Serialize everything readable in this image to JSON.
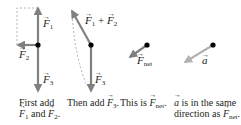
{
  "panels": [
    {
      "id": "panel-1",
      "vectors": [
        {
          "label": "F",
          "sub": "1",
          "direction": "up"
        },
        {
          "label": "F",
          "sub": "2",
          "direction": "left"
        },
        {
          "label": "F",
          "sub": "3",
          "direction": "down"
        }
      ],
      "caption_line1": "First add",
      "caption_line2": {
        "a": "F",
        "a_sub": "1",
        "mid": " and ",
        "b": "F",
        "b_sub": "2",
        "end": "."
      }
    },
    {
      "id": "panel-2",
      "vectors": [
        {
          "label": "F⃗₁ + F⃗₂",
          "sum_a": "F",
          "sum_a_sub": "1",
          "plus": "+",
          "sum_b": "F",
          "sum_b_sub": "2",
          "direction": "up-left"
        },
        {
          "label": "F",
          "sub": "3",
          "direction": "down"
        }
      ],
      "caption_prefix": "Then add ",
      "caption_vec": "F",
      "caption_sub": "3",
      "caption_end": "."
    },
    {
      "id": "panel-3",
      "vectors": [
        {
          "label": "F",
          "sub": "net",
          "direction": "down-left"
        }
      ],
      "caption_prefix": "This is ",
      "caption_vec": "F",
      "caption_sub": "net",
      "caption_end": "."
    },
    {
      "id": "panel-4",
      "vectors": [
        {
          "label": "a",
          "direction": "down-left"
        }
      ],
      "caption_line1_vec": "a",
      "caption_line1_rest": " is in the same",
      "caption_line2_prefix": "direction as ",
      "caption_line2_vec": "F",
      "caption_line2_sub": "net",
      "caption_line2_end": "."
    }
  ],
  "colors": {
    "force_arrow": "#808080",
    "accel_arrow": "#b3b3b3",
    "dashed": "#a0a0a0",
    "dot": "#000000",
    "text": "#231f20"
  }
}
